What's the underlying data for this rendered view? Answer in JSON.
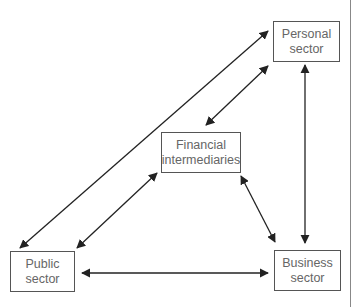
{
  "diagram": {
    "nodes": [
      {
        "id": "personal",
        "lines": [
          "Personal",
          "sector"
        ]
      },
      {
        "id": "financial",
        "lines": [
          "Financial",
          "intermediaries"
        ]
      },
      {
        "id": "public",
        "lines": [
          "Public",
          "sector"
        ]
      },
      {
        "id": "business",
        "lines": [
          "Business",
          "sector"
        ]
      }
    ],
    "edges": [
      {
        "from": "public",
        "to": "personal",
        "type": "bidirectional"
      },
      {
        "from": "public",
        "to": "financial",
        "type": "bidirectional"
      },
      {
        "from": "financial",
        "to": "personal",
        "type": "bidirectional"
      },
      {
        "from": "financial",
        "to": "business",
        "type": "bidirectional"
      },
      {
        "from": "personal",
        "to": "business",
        "type": "bidirectional"
      },
      {
        "from": "public",
        "to": "business",
        "type": "bidirectional"
      }
    ],
    "colors": {
      "line": "#222222",
      "box_border": "#555555",
      "text": "#666666"
    }
  }
}
